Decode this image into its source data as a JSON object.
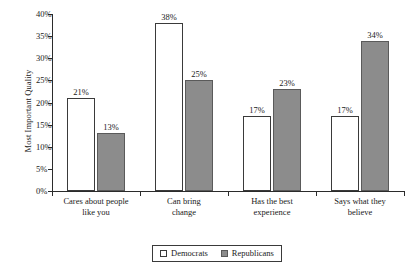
{
  "chart_data": {
    "type": "bar",
    "title": "",
    "xlabel": "",
    "ylabel": "Most Important Quality",
    "ylim": [
      0,
      40
    ],
    "ytick_labels": [
      "0%",
      "5%",
      "10%",
      "15%",
      "20%",
      "25%",
      "30%",
      "35%",
      "40%"
    ],
    "ytick_values": [
      0,
      5,
      10,
      15,
      20,
      25,
      30,
      35,
      40
    ],
    "grid": false,
    "legend_position": "bottom",
    "categories": [
      "Cares about people like you",
      "Can bring change",
      "Has the best experience",
      "Says what they believe"
    ],
    "category_lines": [
      [
        "Cares about people",
        "like you"
      ],
      [
        "Can bring",
        "change"
      ],
      [
        "Has the best",
        "experience"
      ],
      [
        "Says what they",
        "believe"
      ]
    ],
    "series": [
      {
        "name": "Democrats",
        "color": "#ffffff",
        "values": [
          21,
          38,
          17,
          17
        ],
        "labels": [
          "21%",
          "38%",
          "17%",
          "17%"
        ]
      },
      {
        "name": "Republicans",
        "color": "#8c8c8c",
        "values": [
          13,
          25,
          23,
          34
        ],
        "labels": [
          "13%",
          "25%",
          "23%",
          "34%"
        ]
      }
    ]
  },
  "legend": {
    "items": [
      {
        "label": "Democrats"
      },
      {
        "label": "Republicans"
      }
    ]
  }
}
